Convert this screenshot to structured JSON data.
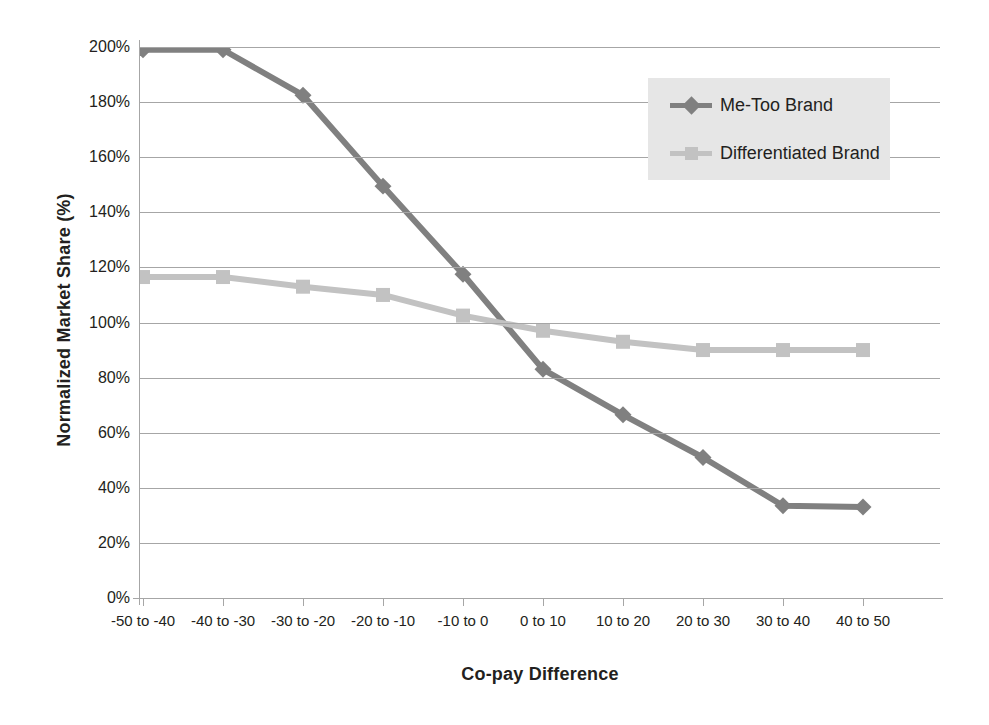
{
  "chart_data": {
    "type": "line",
    "title": "",
    "xlabel": "Co-pay Difference",
    "ylabel": "Normalized Market Share (%)",
    "categories": [
      "-50 to -40",
      "-40 to -30",
      "-30 to -20",
      "-20 to -10",
      "-10 to 0",
      "0 to 10",
      "10 to 20",
      "20 to 30",
      "30 to 40",
      "40 to 50"
    ],
    "ylim": [
      0,
      200
    ],
    "ytick_values": [
      0,
      20,
      40,
      60,
      80,
      100,
      120,
      140,
      160,
      180,
      200
    ],
    "ytick_labels": [
      "0%",
      "20%",
      "40%",
      "60%",
      "80%",
      "100%",
      "120%",
      "140%",
      "160%",
      "180%",
      "200%"
    ],
    "grid": "horizontal",
    "legend_position": "upper-right",
    "series": [
      {
        "name": "Me-Too Brand",
        "color": "#808080",
        "marker": "diamond",
        "values": [
          199,
          199,
          182.5,
          149.5,
          117.5,
          83,
          66.5,
          51,
          33.5,
          33
        ]
      },
      {
        "name": "Differentiated Brand",
        "color": "#c2c2c2",
        "marker": "square",
        "values": [
          116.5,
          116.5,
          113,
          110,
          102.5,
          97,
          93,
          90,
          90,
          90
        ]
      }
    ]
  },
  "axes": {
    "y_title": "Normalized Market Share (%)",
    "x_title": "Co-pay Difference"
  },
  "legend": {
    "items": [
      {
        "label": "Me-Too Brand"
      },
      {
        "label": "Differentiated Brand"
      }
    ]
  },
  "colors": {
    "series_dark": "#808080",
    "series_light": "#c2c2c2",
    "gridline": "#a6a6a6",
    "legend_bg": "#e6e6e6",
    "text": "#231f20"
  }
}
